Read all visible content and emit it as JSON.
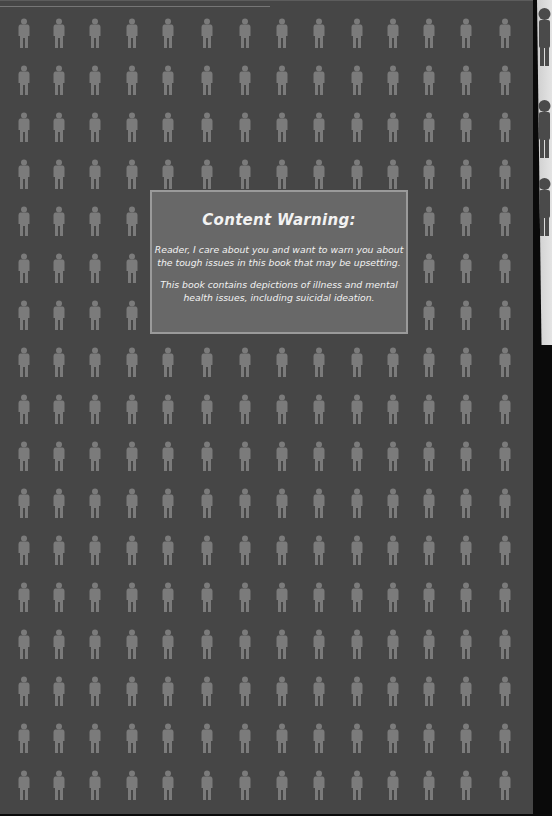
{
  "page": {
    "background_color": "#464646",
    "figure_color": "#7b7b7b",
    "pattern": {
      "icon": "person-icon",
      "columns": 14,
      "rows": 17,
      "column_x": [
        24,
        59,
        95,
        132,
        168,
        207,
        245,
        282,
        319,
        357,
        393,
        429,
        466,
        505
      ],
      "first_row_y": 17,
      "row_spacing": 47
    }
  },
  "content_warning": {
    "title": "Content Warning:",
    "paragraph_1_line_1": "Reader, I care about you and want to warn you about",
    "paragraph_1_line_2": "the tough issues in this book that may be upsetting.",
    "paragraph_2_line_1": "This book contains depictions of illness and mental",
    "paragraph_2_line_2": "health issues, including suicidal ideation.",
    "box_color": "#686868",
    "border_color": "#9a9a9a"
  },
  "adjacent_page_strip": {
    "color": "#d6d6d6",
    "figure_color": "#4a4a4a",
    "figure_tops": [
      8,
      100,
      178
    ]
  }
}
